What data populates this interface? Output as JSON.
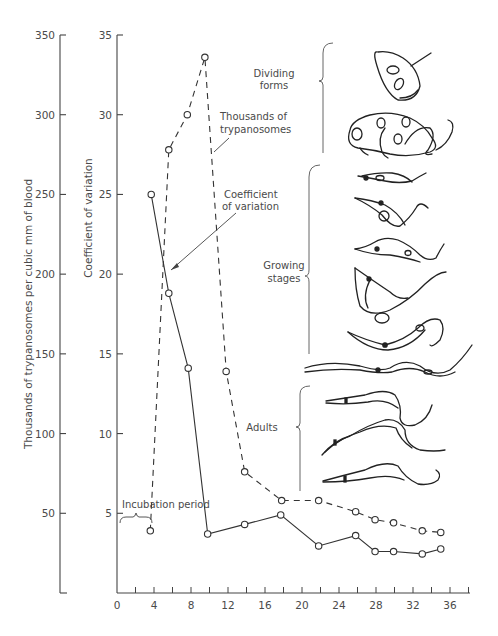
{
  "chart_data": {
    "type": "line",
    "title": "",
    "xlabel": "",
    "x_ticks": [
      0,
      4,
      8,
      12,
      16,
      20,
      24,
      28,
      32,
      36
    ],
    "x_minor_step": 2,
    "xlim": [
      0,
      38
    ],
    "left_axis": {
      "label": "Thousands of trypanosomes per cubic mm of blood",
      "ticks": [
        50,
        100,
        150,
        200,
        250,
        300,
        350
      ],
      "ylim": [
        0,
        350
      ]
    },
    "right_axis": {
      "label": "Coefficient of variation",
      "ticks": [
        5,
        10,
        15,
        20,
        25,
        30,
        35
      ],
      "ylim": [
        0,
        35
      ]
    },
    "grid": false,
    "series": [
      {
        "name": "Thousands of trypanosomes",
        "axis": "left",
        "style": "dashed",
        "x": [
          3.6,
          5.6,
          7.6,
          9.5,
          11.8,
          13.8,
          17.8,
          21.8,
          25.8,
          27.9,
          29.9,
          33.0,
          35.0
        ],
        "values": [
          39,
          278,
          300,
          336,
          139,
          76,
          58,
          58,
          51,
          46,
          44,
          39,
          38
        ]
      },
      {
        "name": "Coefficient of variation",
        "axis": "right",
        "style": "solid",
        "x": [
          3.7,
          5.6,
          7.7,
          9.8,
          13.8,
          17.7,
          21.8,
          25.8,
          27.9,
          29.9,
          33.0,
          35.0
        ],
        "values": [
          25.0,
          18.8,
          14.1,
          3.7,
          4.3,
          4.9,
          2.95,
          3.6,
          2.6,
          2.6,
          2.45,
          2.76
        ]
      }
    ],
    "annotations": [
      {
        "text_lines": [
          "Thousands of",
          "trypanosomes"
        ],
        "target_series": "Thousands of trypanosomes"
      },
      {
        "text_lines": [
          "Coefficient",
          "of variation"
        ],
        "target_series": "Coefficient of variation"
      },
      {
        "text_lines": [
          "Incubation period"
        ],
        "brace_x_range": [
          0,
          4
        ]
      },
      {
        "text_lines": [
          "Dividing",
          "forms"
        ],
        "type": "stage-label"
      },
      {
        "text_lines": [
          "Growing",
          "stages"
        ],
        "type": "stage-label"
      },
      {
        "text_lines": [
          "Adults"
        ],
        "type": "stage-label"
      }
    ]
  }
}
